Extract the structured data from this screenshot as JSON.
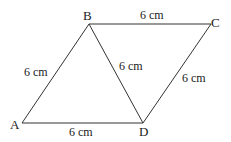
{
  "diagram": {
    "points": {
      "A": {
        "label": "A",
        "x": 22,
        "y": 123
      },
      "B": {
        "label": "B",
        "x": 89,
        "y": 24
      },
      "C": {
        "label": "C",
        "x": 211,
        "y": 24
      },
      "D": {
        "label": "D",
        "x": 143,
        "y": 123
      }
    },
    "segments": [
      {
        "from": "A",
        "to": "B",
        "length": "6 cm"
      },
      {
        "from": "B",
        "to": "C",
        "length": "6 cm"
      },
      {
        "from": "C",
        "to": "D",
        "length": "6 cm"
      },
      {
        "from": "A",
        "to": "D",
        "length": "6 cm"
      },
      {
        "from": "B",
        "to": "D",
        "length": "6 cm"
      }
    ],
    "line_color": "#333333"
  }
}
